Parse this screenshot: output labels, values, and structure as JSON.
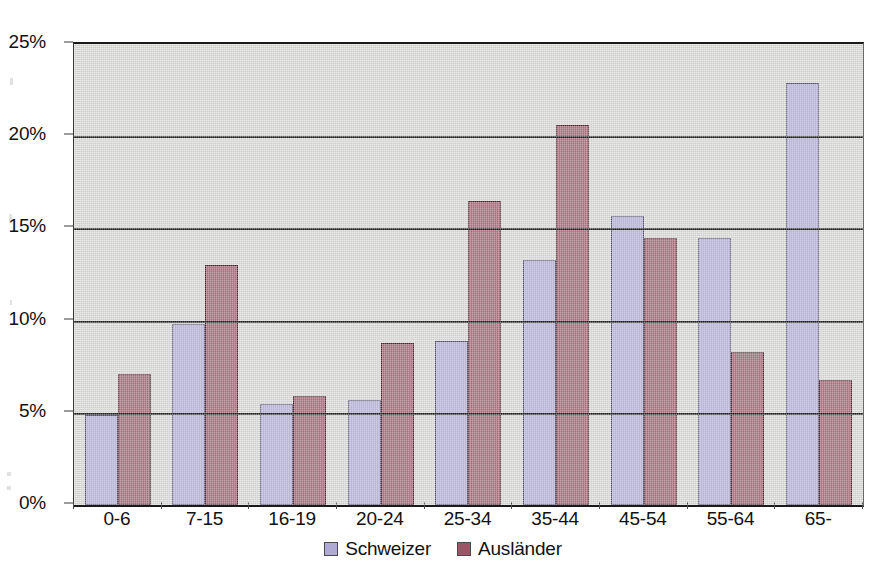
{
  "chart_data": {
    "type": "bar",
    "title": "",
    "xlabel": "",
    "ylabel": "",
    "categories": [
      "0-6",
      "7-15",
      "16-19",
      "20-24",
      "25-34",
      "35-44",
      "45-54",
      "55-64",
      "65-"
    ],
    "series": [
      {
        "name": "Schweizer",
        "color": "#aeaad4",
        "values": [
          4.9,
          9.8,
          5.5,
          5.7,
          8.9,
          13.3,
          15.7,
          14.5,
          22.9
        ]
      },
      {
        "name": "Ausländer",
        "color": "#9c5566",
        "values": [
          7.1,
          13.0,
          5.9,
          8.8,
          16.5,
          20.6,
          14.5,
          8.3,
          6.8
        ]
      }
    ],
    "ylim": [
      0,
      25
    ],
    "ytick_values": [
      0,
      5,
      10,
      15,
      20,
      25
    ],
    "ytick_labels": [
      "0%",
      "5%",
      "10%",
      "15%",
      "20%",
      "25%"
    ],
    "grid": true,
    "grid_axis": "y",
    "legend_position": "bottom",
    "value_suffix": "%",
    "plot_background": "#d5d5d3",
    "page_background": "#ffffff"
  }
}
